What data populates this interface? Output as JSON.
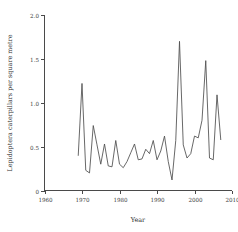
{
  "chart_data": {
    "type": "line",
    "title": "",
    "xlabel": "Year",
    "ylabel": "Lepidoptera caterpillars per square metre",
    "xlim": [
      1960,
      2010
    ],
    "ylim": [
      0,
      2.0
    ],
    "xticks": [
      1960,
      1970,
      1980,
      1990,
      2000,
      2010
    ],
    "xtick_labels": [
      "1960",
      "1970",
      "1980",
      "1990",
      "2000",
      "2010"
    ],
    "yticks": [
      0,
      0.5,
      1.0,
      1.5,
      2.0
    ],
    "ytick_labels": [
      "0",
      "0.5",
      "1.0",
      "1.5",
      "2.0"
    ],
    "grid": false,
    "legend": false,
    "line_color": "#4d4d4d",
    "x": [
      1969,
      1970,
      1971,
      1972,
      1973,
      1974,
      1975,
      1976,
      1977,
      1978,
      1979,
      1980,
      1981,
      1982,
      1983,
      1984,
      1985,
      1986,
      1987,
      1988,
      1989,
      1990,
      1991,
      1992,
      1993,
      1994,
      1995,
      1996,
      1997,
      1998,
      1999,
      2000,
      2001,
      2002,
      2003,
      2004,
      2005,
      2006,
      2007
    ],
    "values": [
      0.4,
      1.22,
      0.23,
      0.2,
      0.74,
      0.52,
      0.3,
      0.53,
      0.28,
      0.27,
      0.57,
      0.3,
      0.26,
      0.33,
      0.43,
      0.53,
      0.35,
      0.36,
      0.47,
      0.42,
      0.57,
      0.35,
      0.45,
      0.62,
      0.33,
      0.12,
      0.57,
      1.7,
      0.52,
      0.37,
      0.42,
      0.62,
      0.6,
      0.8,
      1.48,
      0.37,
      0.35,
      1.09,
      0.58
    ],
    "series": [
      {
        "name": "Lepidoptera caterpillars per square metre",
        "values": [
          0.4,
          1.22,
          0.23,
          0.2,
          0.74,
          0.52,
          0.3,
          0.53,
          0.28,
          0.27,
          0.57,
          0.3,
          0.26,
          0.33,
          0.43,
          0.53,
          0.35,
          0.36,
          0.47,
          0.42,
          0.57,
          0.35,
          0.45,
          0.62,
          0.33,
          0.12,
          0.57,
          1.7,
          0.52,
          0.37,
          0.42,
          0.62,
          0.6,
          0.8,
          1.48,
          0.37,
          0.35,
          1.09,
          0.58
        ]
      }
    ]
  }
}
